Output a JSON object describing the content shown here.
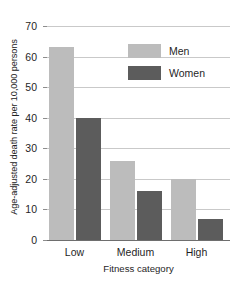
{
  "chart_data": {
    "type": "bar",
    "title": "",
    "xlabel": "Fitness category",
    "ylabel": "Age-adjusted death rate per 10,000 persons",
    "categories": [
      "Low",
      "Medium",
      "High"
    ],
    "series": [
      {
        "name": "Men",
        "color": "#bcbcbc",
        "values": [
          63,
          26,
          20
        ]
      },
      {
        "name": "Women",
        "color": "#5c5c5c",
        "values": [
          40,
          16,
          7
        ]
      }
    ],
    "ylim": [
      0,
      70
    ],
    "yticks": [
      0,
      10,
      20,
      30,
      40,
      50,
      60,
      70
    ],
    "ytick_labels": [
      "0",
      "10",
      "20",
      "30",
      "40",
      "50",
      "60",
      "70"
    ],
    "grid": "horizontal",
    "legend_position": "upper-right-inside",
    "legend_entries": [
      "Men",
      "Women"
    ]
  }
}
